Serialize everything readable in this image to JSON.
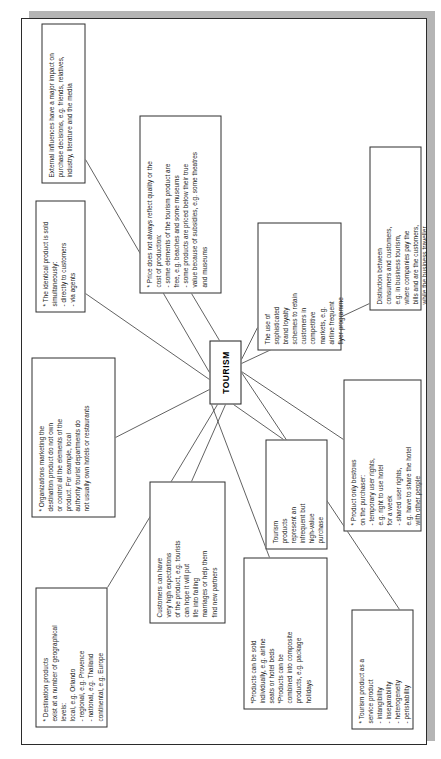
{
  "document": {
    "type": "mind-map",
    "title": "TOURISM",
    "orientation": "rotated-90-ccw",
    "colors": {
      "page": "#ffffff",
      "ink": "#1a1a1a",
      "border": "#2f2f2f",
      "shadow": "#b5b5b5"
    }
  },
  "center": {
    "label": "TOURISM"
  },
  "nodes": [
    {
      "id": "destination",
      "text": "* Destination products\nexist at a number of geographical\nlevels:\nlocal, e.g. Orlando\n- regional, e.g. Provence\n- national, e.g. Thailand\ncontinental, e.g. Europe"
    },
    {
      "id": "organizations",
      "text": "* Organizations marketing the\ndestination product do not own\nor control all the elements of the\nproduct.  For example, local\nauthority tourist departments do\nnot usually own hotels or restaurants"
    },
    {
      "id": "identical",
      "text": "* The identical product is sold\nsimultaneously:\n  - directly to customers\n  - via agents"
    },
    {
      "id": "external",
      "text": "External influences have a major impact on\npurchase decisions, e.g. friends, relatives,\nindustry, literature and the media"
    },
    {
      "id": "customers",
      "text": "Customers can have\nvery high expectations\nof the product, e.g. tourists\ncan hope it will put\nlife into failing\nmarriages or help them\nfind new partners"
    },
    {
      "id": "price",
      "text": "* Price does not always reflect quality or the\ncost of production:\n- some elements of the tourism product are\nfree, e.g. beaches and some museums\n- some products are priced below their true\nvalue because of subsidies, e.g. some theatres\nand museums"
    },
    {
      "id": "products",
      "text": "*Products can be sold\nindividually, e.g. airline\nseats or hotel beds\n*Products can be\ncombined into composite\nproducts, e.g. package\nholidays"
    },
    {
      "id": "tourismprod",
      "text": "Tourism\nproducts\nrepresent an\ninfrequent but\nhigh-value\npurchase"
    },
    {
      "id": "loyalty",
      "text": "The use of\nsophisticated\nbrand loyalty\nschemes to retain\ncustomers in\ncompetitive\nmarkets, e.g.\nairline frequent\nflyer programme"
    },
    {
      "id": "service",
      "text": "* Tourism product as a\n    service product\n  -  intangibility\n  -  inseparability\n  -  heterogeneity\n  -  perishability"
    },
    {
      "id": "bestows",
      "text": "* Product only bestows\non the purchaser:\n- temporary user rights,\ne.g.  right to use hotel\nfor a week\n  - shared user rights,\ne.g. have to share the hotel\nwith other people"
    },
    {
      "id": "distinction",
      "text": "Distinction between\nconsumers and customers,\ne.g. in business tourism,\nwhere companies pay the\nbills and are the customers,\nwhile the business traveller\nuses the service and is the\nconsumer"
    }
  ],
  "edges": [
    {
      "from": "center",
      "to": "destination"
    },
    {
      "from": "center",
      "to": "organizations"
    },
    {
      "from": "center",
      "to": "identical"
    },
    {
      "from": "center",
      "to": "external"
    },
    {
      "from": "center",
      "to": "customers"
    },
    {
      "from": "center",
      "to": "price"
    },
    {
      "from": "center",
      "to": "products"
    },
    {
      "from": "center",
      "to": "tourismprod"
    },
    {
      "from": "center",
      "to": "loyalty"
    },
    {
      "from": "center",
      "to": "service"
    },
    {
      "from": "center",
      "to": "bestows"
    },
    {
      "from": "center",
      "to": "distinction"
    }
  ]
}
